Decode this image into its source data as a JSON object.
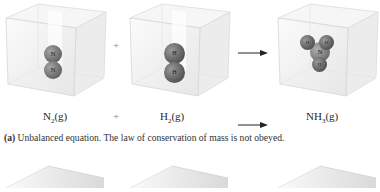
{
  "figure": {
    "row_a": {
      "reactant_1": {
        "formula_base": "N",
        "formula_sub": "2",
        "state": "(g)",
        "atoms": [
          "N",
          "N"
        ]
      },
      "operator_plus": "+",
      "reactant_2": {
        "formula_base": "H",
        "formula_sub": "2",
        "state": "(g)",
        "atoms": [
          "H",
          "H"
        ]
      },
      "arrow": "→",
      "product": {
        "formula_base": "NH",
        "formula_sub": "3",
        "state": "(g)",
        "atoms": [
          "H",
          "H",
          "N",
          "H"
        ]
      },
      "caption_label": "(a)",
      "caption_text": " Unbalanced equation.  The law of conservation of mass is not obeyed."
    },
    "colors": {
      "atom_fill": "#6e6e6e",
      "atom_highlight": "#9a9a9a",
      "cube_edge": "#d6d6d6",
      "cube_face": "#f2f2f2",
      "text": "#2a2a2a"
    }
  }
}
